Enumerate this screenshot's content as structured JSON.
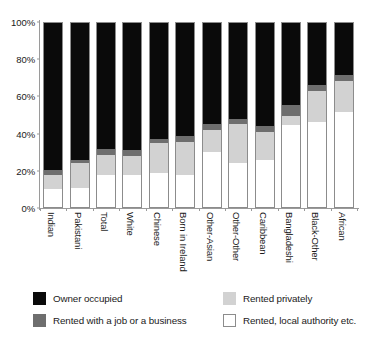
{
  "chart_data": {
    "type": "bar",
    "title": "",
    "subtitle": "",
    "xlabel": "",
    "ylabel": "",
    "ylim": [
      0,
      100
    ],
    "ytick_labels": [
      "0%",
      "20%",
      "40%",
      "60%",
      "80%",
      "100%"
    ],
    "ytick_values": [
      0,
      20,
      40,
      60,
      80,
      100
    ],
    "grid": false,
    "stacked": true,
    "stack_total": 100,
    "legend_position": "bottom",
    "categories": [
      "Indian",
      "Pakistani",
      "Total",
      "White",
      "Chinese",
      "Born in Ireland",
      "Other-Asian",
      "Other-Other",
      "Caribbean",
      "Bangladeshi",
      "Black-Other",
      "African"
    ],
    "series": [
      {
        "name": "Owner occupied",
        "color": "#0a0a0a",
        "values": [
          79.5,
          74.0,
          68.5,
          69.0,
          63.0,
          61.5,
          55.0,
          52.0,
          56.0,
          44.5,
          34.0,
          28.5
        ]
      },
      {
        "name": "Rented with a job or a business",
        "color": "#6e6e6e",
        "values": [
          3.0,
          2.0,
          3.0,
          3.0,
          2.0,
          3.0,
          3.0,
          3.0,
          3.0,
          6.0,
          3.0,
          3.0
        ]
      },
      {
        "name": "Rented privately",
        "color": "#d2d2d2",
        "values": [
          7.5,
          13.0,
          11.0,
          10.0,
          16.0,
          17.5,
          12.0,
          21.0,
          15.0,
          5.0,
          17.0,
          17.0
        ]
      },
      {
        "name": "Rented, local authority etc.",
        "color": "#ffffff",
        "values": [
          10.0,
          11.0,
          17.5,
          18.0,
          19.0,
          18.0,
          30.0,
          24.0,
          26.0,
          44.5,
          46.0,
          51.5
        ]
      }
    ]
  },
  "legend": {
    "items": [
      {
        "label": "Owner occupied",
        "swatch": "sw-owner"
      },
      {
        "label": "Rented privately",
        "swatch": "sw-privately"
      },
      {
        "label": "Rented with a job or a business",
        "swatch": "sw-jobbiz"
      },
      {
        "label": "Rented, local authority etc.",
        "swatch": "sw-authority"
      }
    ]
  }
}
